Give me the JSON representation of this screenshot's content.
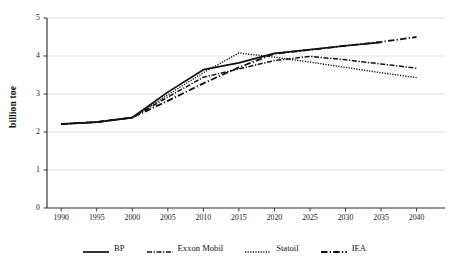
{
  "chart_data": {
    "type": "line",
    "title": "",
    "subtitle": "",
    "xlabel": "",
    "ylabel": "billion toe",
    "xlim": [
      1988,
      2044
    ],
    "ylim": [
      0,
      5
    ],
    "xticks": [
      1990,
      1995,
      2000,
      2005,
      2010,
      2015,
      2020,
      2025,
      2030,
      2035,
      2040
    ],
    "yticks": [
      0,
      1,
      2,
      3,
      4,
      5
    ],
    "xtick_labels": [
      "1990",
      "1995",
      "2000",
      "2005",
      "2010",
      "2015",
      "2020",
      "2025",
      "2030",
      "2035",
      "2040"
    ],
    "ytick_labels": [
      "0",
      "1",
      "2",
      "3",
      "4",
      "5"
    ],
    "grid": "horizontal",
    "legend_position": "bottom",
    "series": [
      {
        "name": "BP",
        "line_style": "solid",
        "color": "#111111",
        "x": [
          1990,
          1995,
          2000,
          2005,
          2010,
          2015,
          2020,
          2025,
          2030,
          2035
        ],
        "values": [
          2.21,
          2.26,
          2.38,
          3.05,
          3.64,
          3.82,
          4.07,
          4.17,
          4.27,
          4.36
        ]
      },
      {
        "name": "Exxon Mobil",
        "line_style": "dash-dot",
        "color": "#111111",
        "x": [
          1990,
          1995,
          2000,
          2005,
          2010,
          2015,
          2020,
          2025,
          2030,
          2035,
          2040
        ],
        "values": [
          2.21,
          2.26,
          2.38,
          2.92,
          3.44,
          3.66,
          3.88,
          3.99,
          3.9,
          3.79,
          3.68
        ]
      },
      {
        "name": "Statoil",
        "line_style": "dotted",
        "color": "#111111",
        "x": [
          1990,
          1995,
          2000,
          2005,
          2010,
          2015,
          2020,
          2025,
          2030,
          2035,
          2040
        ],
        "values": [
          2.21,
          2.26,
          2.38,
          2.98,
          3.56,
          4.08,
          3.97,
          3.84,
          3.7,
          3.56,
          3.43
        ]
      },
      {
        "name": "IEA",
        "line_style": "long-dash",
        "color": "#111111",
        "x": [
          1990,
          1995,
          2000,
          2005,
          2010,
          2015,
          2020,
          2025,
          2030,
          2035,
          2040
        ],
        "values": [
          2.21,
          2.26,
          2.38,
          2.82,
          3.28,
          3.7,
          4.06,
          4.16,
          4.27,
          4.37,
          4.5
        ]
      }
    ]
  },
  "legend": {
    "items": [
      {
        "label": "BP",
        "style": "solid"
      },
      {
        "label": "Exxon Mobil",
        "style": "dash-dot"
      },
      {
        "label": "Statoil",
        "style": "dotted"
      },
      {
        "label": "IEA",
        "style": "long-dash"
      }
    ]
  },
  "axes": {
    "y_title": "billion toe"
  }
}
